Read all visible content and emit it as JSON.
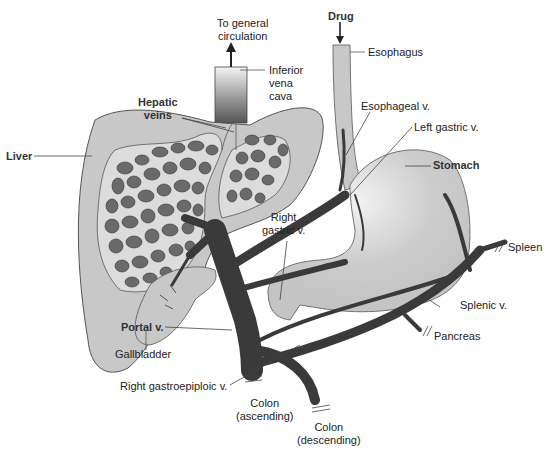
{
  "diagram": {
    "colors": {
      "organ_fill": "#c8c8c8",
      "organ_stroke": "#555555",
      "vessel": "#3a3a3a",
      "lobule": "#6a6a6a",
      "background": "#ffffff"
    },
    "labels": {
      "to_general_circulation": "To general\ncirculation",
      "to_general_line1": "To general",
      "to_general_line2": "circulation",
      "inferior_vena_cava_1": "Inferior",
      "inferior_vena_cava_2": "vena",
      "inferior_vena_cava_3": "cava",
      "drug": "Drug",
      "esophagus": "Esophagus",
      "hepatic_veins_1": "Hepatic",
      "hepatic_veins_2": "veins",
      "esophageal_v": "Esophageal v.",
      "left_gastric_v": "Left gastric v.",
      "liver": "Liver",
      "stomach": "Stomach",
      "right_gastric_v_1": "Right",
      "right_gastric_v_2": "gastric v.",
      "spleen": "Spleen",
      "splenic_v": "Splenic v.",
      "portal_v": "Portal v.",
      "pancreas": "Pancreas",
      "gallbladder": "Gallbladder",
      "right_gastroepiploic_v": "Right gastroepiploic v.",
      "colon_ascending_1": "Colon",
      "colon_ascending_2": "(ascending)",
      "colon_descending_1": "Colon",
      "colon_descending_2": "(descending)"
    }
  }
}
